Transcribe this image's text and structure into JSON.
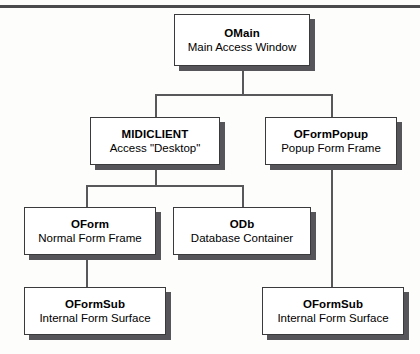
{
  "diagram": {
    "kind": "class-hierarchy-tree",
    "top_rule_color": "#4a4a4d",
    "box_border_color": "#3a3a3c",
    "box_shadow_color": "#55555a",
    "connector_color": "#58585a",
    "nodes": [
      {
        "id": "omain",
        "title": "OMain",
        "subtitle": "Main Access Window"
      },
      {
        "id": "midiclient",
        "title": "MIDICLIENT",
        "subtitle": "Access \"Desktop\""
      },
      {
        "id": "oformpopup",
        "title": "OFormPopup",
        "subtitle": "Popup Form Frame"
      },
      {
        "id": "oform",
        "title": "OForm",
        "subtitle": "Normal Form Frame"
      },
      {
        "id": "odb",
        "title": "ODb",
        "subtitle": "Database Container"
      },
      {
        "id": "oformsub_left",
        "title": "OFormSub",
        "subtitle": "Internal Form Surface"
      },
      {
        "id": "oformsub_right",
        "title": "OFormSub",
        "subtitle": "Internal Form Surface"
      }
    ],
    "edges": [
      {
        "from": "omain",
        "to": "midiclient"
      },
      {
        "from": "omain",
        "to": "oformpopup"
      },
      {
        "from": "midiclient",
        "to": "oform"
      },
      {
        "from": "midiclient",
        "to": "odb"
      },
      {
        "from": "oform",
        "to": "oformsub_left"
      },
      {
        "from": "oformpopup",
        "to": "oformsub_right"
      }
    ]
  }
}
